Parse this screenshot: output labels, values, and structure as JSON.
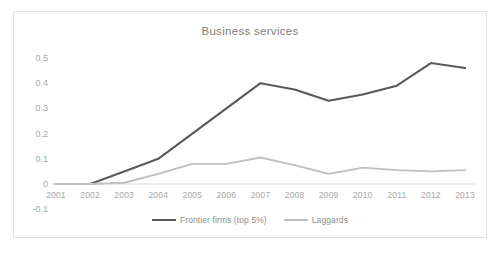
{
  "chart_data": {
    "type": "line",
    "title": "Business services",
    "xlabel": "",
    "ylabel": "",
    "x": [
      2001,
      2002,
      2003,
      2004,
      2005,
      2006,
      2007,
      2008,
      2009,
      2010,
      2011,
      2012,
      2013
    ],
    "categories": [
      "2001",
      "2002",
      "2003",
      "2004",
      "2005",
      "2006",
      "2007",
      "2008",
      "2009",
      "2010",
      "2011",
      "2012",
      "2013"
    ],
    "series": [
      {
        "name": "Frontier firms (top 5%)",
        "color": "#595959",
        "values": [
          0.0,
          0.0,
          0.05,
          0.1,
          0.2,
          0.3,
          0.4,
          0.375,
          0.33,
          0.355,
          0.39,
          0.48,
          0.46
        ]
      },
      {
        "name": "Laggards",
        "color": "#bfbfbf",
        "values": [
          0.0,
          0.0,
          0.005,
          0.04,
          0.08,
          0.08,
          0.105,
          0.075,
          0.04,
          0.065,
          0.055,
          0.05,
          0.055
        ]
      }
    ],
    "yticks": [
      0.5,
      0.4,
      0.3,
      0.2,
      0.1,
      0,
      -0.1
    ],
    "ytick_labels": [
      "0.5",
      "0.4",
      "0.3",
      "0.2",
      "0.1",
      "0",
      "-0.1"
    ],
    "ylim": [
      -0.1,
      0.5
    ],
    "xlim": [
      2001,
      2013
    ],
    "grid": false,
    "zero_axis_line": true,
    "legend_position": "bottom",
    "border_color": "#e2e2e2",
    "tick_label_color": "#a6a6a6",
    "title_color": "#808080",
    "background": "#ffffff"
  }
}
